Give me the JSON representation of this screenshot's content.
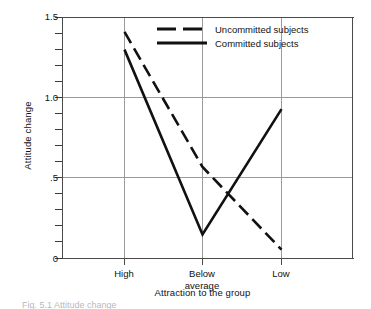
{
  "chart_data": {
    "type": "line",
    "title": "",
    "xlabel": "Attraction to the group",
    "ylabel": "Attitude change",
    "categories": [
      "High",
      "Below\naverage",
      "Low"
    ],
    "category_labels_flat": [
      "High",
      "Below average",
      "Low"
    ],
    "ylim": [
      0,
      1.5
    ],
    "yticks": [
      0,
      0.5,
      1.0,
      1.5
    ],
    "ytick_labels": [
      "0",
      ".5",
      "1.0",
      "1.5"
    ],
    "yminor_step": 0.1,
    "grid": "horizontal-major-only",
    "legend_position": "top-center",
    "series": [
      {
        "name": "Uncommitted subjects",
        "style": "dashed",
        "color": "#111111",
        "values": [
          1.41,
          0.57,
          0.055
        ]
      },
      {
        "name": "Committed subjects",
        "style": "solid",
        "color": "#111111",
        "values": [
          1.3,
          0.15,
          0.93
        ]
      }
    ]
  },
  "legend": {
    "items": [
      {
        "label": "Uncommitted subjects",
        "style": "dashed"
      },
      {
        "label": "Committed subjects",
        "style": "solid"
      }
    ]
  },
  "axes": {
    "y_title": "Attitude change",
    "x_title": "Attraction to the group",
    "y_tick_labels": [
      "1.5",
      "1.0",
      ".5",
      "0"
    ],
    "x_tick_labels": [
      "High",
      "Below\naverage",
      "Low"
    ]
  },
  "caption": {
    "cut_off_text": "Fig. 5.1  Attitude change"
  }
}
